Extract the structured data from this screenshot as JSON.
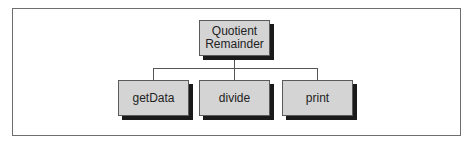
{
  "diagram": {
    "type": "hierarchy",
    "root": {
      "label_lines": [
        "Quotient",
        "Remainder"
      ]
    },
    "children": [
      {
        "label": "getData"
      },
      {
        "label": "divide"
      },
      {
        "label": "print"
      }
    ],
    "colors": {
      "node_fill": "#d4d4d4",
      "node_border": "#5a5a5a",
      "shadow": "#1a1a1a",
      "connector": "#555555",
      "frame_border": "#6e6e6e",
      "background": "#ffffff"
    }
  }
}
